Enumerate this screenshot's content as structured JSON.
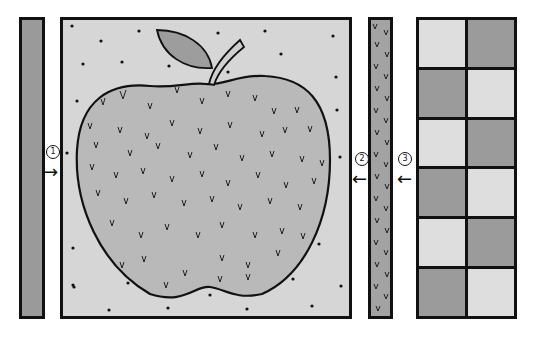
{
  "diagram": {
    "title": "",
    "panels": [
      {
        "id": "strip-left",
        "description": "solid dark gray strip",
        "color": "#9a9a9a"
      },
      {
        "id": "main-panel",
        "description": "apple illustration on dotted light gray background",
        "color": "#d6d6d6"
      },
      {
        "id": "strip-right",
        "description": "gray strip with v-shaped grass marks",
        "color": "#a3a3a3"
      },
      {
        "id": "checker",
        "description": "2x6 checkerboard of light and dark gray squares"
      }
    ],
    "labels": [
      {
        "number": "1",
        "arrow": "→",
        "x": 46,
        "y": 146
      },
      {
        "number": "2",
        "arrow": "←",
        "x": 355,
        "y": 153
      },
      {
        "number": "3",
        "arrow": "←",
        "x": 398,
        "y": 153
      }
    ],
    "checker_pattern": [
      [
        "light",
        "dark"
      ],
      [
        "dark",
        "light"
      ],
      [
        "light",
        "dark"
      ],
      [
        "dark",
        "light"
      ],
      [
        "light",
        "dark"
      ],
      [
        "dark",
        "light"
      ]
    ],
    "colors": {
      "outline": "#111111",
      "apple_fill": "#b9b9b9",
      "leaf_fill": "#9d9d9d",
      "stem_fill": "#cfcfcf",
      "background_light": "#d6d6d6"
    }
  }
}
